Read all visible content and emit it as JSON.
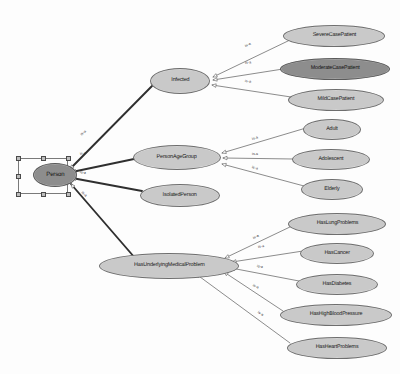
{
  "diagram": {
    "type": "ontology-is-a-hierarchy",
    "edge_label": "is-a",
    "colors": {
      "background": "#fdfdfd",
      "node_fill": "#c9c9c9",
      "node_selected_fill": "#8d8d8d",
      "node_stroke": "#6e6e6e",
      "edge_stroke": "#5a5a5a",
      "edge_stroke_thick": "#2f2f2f",
      "selection_box": "#7a7a7a",
      "handle_fill": "#bdbdbd",
      "text": "#1a1a1a"
    },
    "root": {
      "label": "Person",
      "selected": true,
      "x": 33,
      "y": 163,
      "w": 44,
      "h": 24,
      "font_size": 6.2,
      "selection_box": {
        "x": 18,
        "y": 158,
        "w": 50,
        "h": 36
      }
    },
    "branch_nodes": [
      {
        "id": "infected",
        "label": "Infected",
        "x": 150,
        "y": 68,
        "w": 60,
        "h": 26,
        "font_size": 5.6,
        "selected": false
      },
      {
        "id": "person_age_group",
        "label": "PersonAgeGroup",
        "x": 133,
        "y": 145,
        "w": 88,
        "h": 25,
        "font_size": 5.6,
        "selected": false
      },
      {
        "id": "isolated_person",
        "label": "IsolatedPerson",
        "x": 140,
        "y": 184,
        "w": 80,
        "h": 23,
        "font_size": 5.6,
        "selected": false
      },
      {
        "id": "has_underlying",
        "label": "HasUnderlyingMedicalProblem",
        "x": 99,
        "y": 253,
        "w": 140,
        "h": 26,
        "font_size": 5.6,
        "selected": false
      }
    ],
    "leaf_nodes": [
      {
        "id": "severe_case_patient",
        "label": "SevereCasePatient",
        "parent": "infected",
        "x": 283,
        "y": 25,
        "w": 102,
        "h": 22,
        "font_size": 5.5,
        "selected": false
      },
      {
        "id": "moderate_case_patient",
        "label": "ModerateCasePatient",
        "parent": "infected",
        "x": 280,
        "y": 58,
        "w": 110,
        "h": 22,
        "font_size": 5.5,
        "selected": true
      },
      {
        "id": "mild_case_patient",
        "label": "MildCasePatient",
        "parent": "infected",
        "x": 288,
        "y": 89,
        "w": 96,
        "h": 22,
        "font_size": 5.5,
        "selected": false
      },
      {
        "id": "adult",
        "label": "Adult",
        "parent": "person_age_group",
        "x": 303,
        "y": 119,
        "w": 58,
        "h": 21,
        "font_size": 5.5,
        "selected": false
      },
      {
        "id": "adolescent",
        "label": "Adolescent",
        "parent": "person_age_group",
        "x": 292,
        "y": 149,
        "w": 78,
        "h": 21,
        "font_size": 5.5,
        "selected": false
      },
      {
        "id": "elderly",
        "label": "Elderly",
        "parent": "person_age_group",
        "x": 301,
        "y": 179,
        "w": 62,
        "h": 21,
        "font_size": 5.5,
        "selected": false
      },
      {
        "id": "has_lung_problems",
        "label": "HasLungProblems",
        "parent": "has_underlying",
        "x": 288,
        "y": 213,
        "w": 98,
        "h": 22,
        "font_size": 5.5,
        "selected": false
      },
      {
        "id": "has_cancer",
        "label": "HasCancer",
        "parent": "has_underlying",
        "x": 300,
        "y": 243,
        "w": 74,
        "h": 21,
        "font_size": 5.5,
        "selected": false
      },
      {
        "id": "has_diabetes",
        "label": "HasDiabetes",
        "parent": "has_underlying",
        "x": 296,
        "y": 274,
        "w": 82,
        "h": 21,
        "font_size": 5.5,
        "selected": false
      },
      {
        "id": "has_high_blood_pressure",
        "label": "HasHighBloodPressure",
        "parent": "has_underlying",
        "x": 280,
        "y": 304,
        "w": 112,
        "h": 22,
        "font_size": 5.5,
        "selected": false
      },
      {
        "id": "has_heart_problems",
        "label": "HasHeartProblems",
        "parent": "has_underlying",
        "x": 287,
        "y": 337,
        "w": 100,
        "h": 22,
        "font_size": 5.5,
        "selected": false
      }
    ],
    "edges": [
      {
        "id": "person-infected",
        "from": "root",
        "to": "infected",
        "x1": 70,
        "y1": 169,
        "x2": 152,
        "y2": 86,
        "thick": true,
        "label": "is-a",
        "lx": 81,
        "ly": 133,
        "angle": -44
      },
      {
        "id": "person-age-group",
        "from": "root",
        "to": "person_age_group",
        "x1": 72,
        "y1": 172,
        "x2": 134,
        "y2": 159,
        "thick": true,
        "label": "is-a",
        "lx": 80,
        "ly": 152,
        "angle": -12
      },
      {
        "id": "person-isolated",
        "from": "root",
        "to": "isolated_person",
        "x1": 72,
        "y1": 178,
        "x2": 142,
        "y2": 191,
        "thick": true,
        "label": "is-a",
        "lx": 80,
        "ly": 170,
        "angle": 10
      },
      {
        "id": "person-underlying",
        "from": "root",
        "to": "has_underlying",
        "x1": 71,
        "y1": 184,
        "x2": 135,
        "y2": 258,
        "thick": true,
        "label": "is-a",
        "lx": 82,
        "ly": 190,
        "angle": 45
      },
      {
        "id": "infected-severe",
        "from": "infected",
        "to": "severe_case_patient",
        "x1": 213,
        "y1": 77,
        "x2": 290,
        "y2": 40,
        "thick": false,
        "label": "is-a",
        "lx": 245,
        "ly": 44,
        "angle": -23
      },
      {
        "id": "infected-moderate",
        "from": "infected",
        "to": "moderate_case_patient",
        "x1": 213,
        "y1": 80,
        "x2": 283,
        "y2": 69,
        "thick": false,
        "label": "is-a",
        "lx": 245,
        "ly": 61,
        "angle": -8
      },
      {
        "id": "infected-mild",
        "from": "infected",
        "to": "mild_case_patient",
        "x1": 212,
        "y1": 85,
        "x2": 291,
        "y2": 97,
        "thick": false,
        "label": "is-a",
        "lx": 245,
        "ly": 79,
        "angle": 8
      },
      {
        "id": "age-adult",
        "from": "person_age_group",
        "to": "adult",
        "x1": 222,
        "y1": 153,
        "x2": 306,
        "y2": 128,
        "thick": false,
        "label": "is-a",
        "lx": 252,
        "ly": 137,
        "angle": -16
      },
      {
        "id": "age-adolescent",
        "from": "person_age_group",
        "to": "adolescent",
        "x1": 223,
        "y1": 158,
        "x2": 293,
        "y2": 159,
        "thick": false,
        "label": "is-a",
        "lx": 252,
        "ly": 152,
        "angle": 0
      },
      {
        "id": "age-elderly",
        "from": "person_age_group",
        "to": "elderly",
        "x1": 222,
        "y1": 164,
        "x2": 304,
        "y2": 186,
        "thick": false,
        "label": "is-a",
        "lx": 252,
        "ly": 165,
        "angle": 15
      },
      {
        "id": "underlying-lung",
        "from": "has_underlying",
        "to": "has_lung_problems",
        "x1": 225,
        "y1": 258,
        "x2": 292,
        "y2": 226,
        "thick": false,
        "label": "is-a",
        "lx": 253,
        "ly": 236,
        "angle": -25
      },
      {
        "id": "underlying-cancer",
        "from": "has_underlying",
        "to": "has_cancer",
        "x1": 232,
        "y1": 262,
        "x2": 303,
        "y2": 251,
        "thick": false,
        "label": "is-a",
        "lx": 258,
        "ly": 245,
        "angle": -9
      },
      {
        "id": "underlying-diabetes",
        "from": "has_underlying",
        "to": "has_diabetes",
        "x1": 231,
        "y1": 268,
        "x2": 299,
        "y2": 281,
        "thick": false,
        "label": "is-a",
        "lx": 257,
        "ly": 264,
        "angle": 11
      },
      {
        "id": "underlying-pressure",
        "from": "has_underlying",
        "to": "has_high_blood_pressure",
        "x1": 224,
        "y1": 272,
        "x2": 283,
        "y2": 311,
        "thick": false,
        "label": "is-a",
        "lx": 253,
        "ly": 283,
        "angle": 28
      },
      {
        "id": "underlying-heart",
        "from": "has_underlying",
        "to": "has_heart_problems",
        "x1": 196,
        "y1": 274,
        "x2": 290,
        "y2": 343,
        "thick": false,
        "label": "is-a",
        "lx": 258,
        "ly": 310,
        "angle": 33
      }
    ]
  }
}
